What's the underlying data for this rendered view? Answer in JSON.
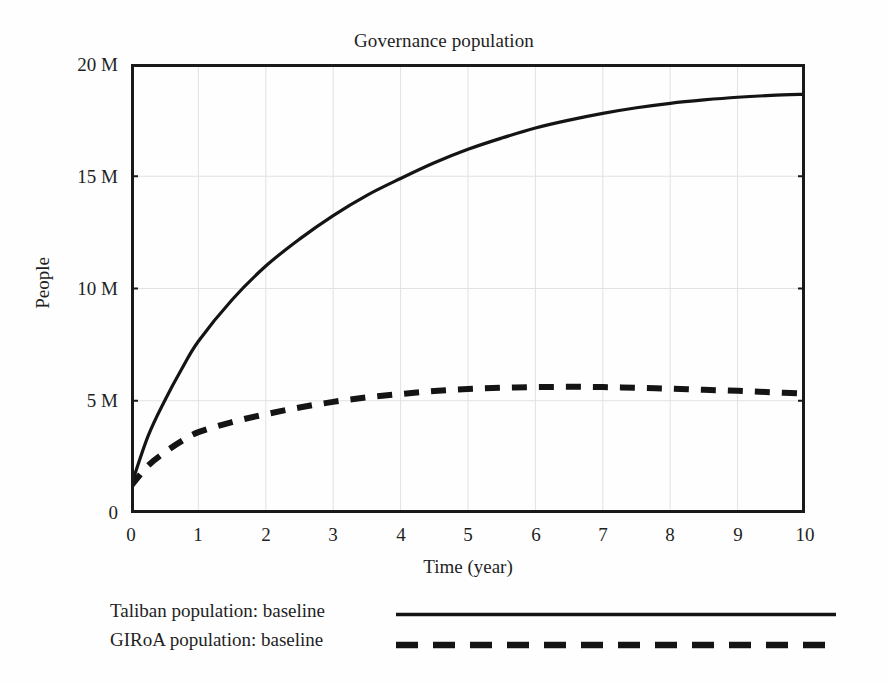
{
  "chart_data": {
    "type": "line",
    "title": "Governance population",
    "xlabel": "Time (year)",
    "ylabel": "People",
    "xlim": [
      0,
      10
    ],
    "ylim": [
      0,
      20000000
    ],
    "xticks": [
      "0",
      "1",
      "2",
      "3",
      "4",
      "5",
      "6",
      "7",
      "8",
      "9",
      "10"
    ],
    "xtick_values": [
      0,
      1,
      2,
      3,
      4,
      5,
      6,
      7,
      8,
      9,
      10
    ],
    "yticks": [
      "0",
      "5 M",
      "10 M",
      "15 M",
      "20 M"
    ],
    "ytick_values": [
      0,
      5000000,
      10000000,
      15000000,
      20000000
    ],
    "grid": true,
    "legend_position": "below",
    "x": [
      0,
      0.25,
      0.5,
      0.75,
      1,
      1.5,
      2,
      2.5,
      3,
      3.5,
      4,
      4.5,
      5,
      5.5,
      6,
      6.5,
      7,
      7.5,
      8,
      8.5,
      9,
      9.5,
      10
    ],
    "series": [
      {
        "name": "Taliban population: baseline",
        "style": "solid",
        "color": "#141414",
        "values": [
          1200000,
          3400000,
          5000000,
          6400000,
          7650000,
          9500000,
          11000000,
          12200000,
          13250000,
          14150000,
          14900000,
          15600000,
          16200000,
          16700000,
          17150000,
          17500000,
          17800000,
          18050000,
          18250000,
          18400000,
          18520000,
          18600000,
          18650000
        ]
      },
      {
        "name": "GIRoA population: baseline",
        "style": "dashed",
        "color": "#141414",
        "values": [
          1200000,
          2100000,
          2700000,
          3200000,
          3600000,
          4050000,
          4400000,
          4700000,
          4950000,
          5150000,
          5300000,
          5430000,
          5520000,
          5580000,
          5610000,
          5620000,
          5610000,
          5580000,
          5540000,
          5490000,
          5440000,
          5380000,
          5320000
        ]
      }
    ]
  },
  "legend": {
    "items": [
      {
        "label": "Taliban population: baseline",
        "style": "solid"
      },
      {
        "label": "GIRoA population: baseline",
        "style": "dashed"
      }
    ]
  }
}
